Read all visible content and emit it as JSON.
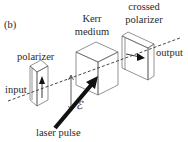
{
  "panel_label": "(b)",
  "labels": {
    "polarizer": "polarizer",
    "kerr_line1": "Kerr",
    "kerr_line2": "medium",
    "crossed_line1": "crossed",
    "crossed_line2": "polarizer",
    "output": "output",
    "input": "input",
    "laser_pulse": "laser pulse",
    "field_symbol": "ℰ"
  },
  "colors": {
    "line": "#555555",
    "beam": "#333333",
    "laser": "#111111",
    "text": "#2a2a2a"
  }
}
